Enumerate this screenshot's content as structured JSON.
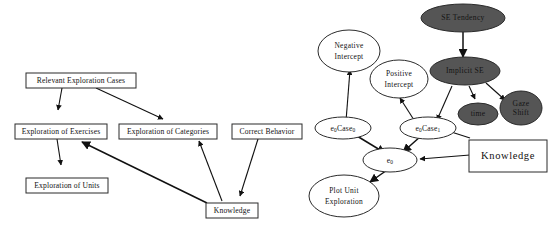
{
  "figure": {
    "colors": {
      "background": "#ffffff",
      "stroke": "#111111",
      "node_fill_light": "#ffffff",
      "node_fill_dark": "#555555"
    }
  },
  "left_diagram": {
    "name": "exploration-case-flow",
    "nodes": [
      {
        "id": "relevant_exploration_cases",
        "label": "Relevant Exploration Cases",
        "shape": "rect"
      },
      {
        "id": "exploration_of_exercises",
        "label": "Exploration of Exercises",
        "shape": "rect"
      },
      {
        "id": "exploration_of_categories",
        "label": "Exploration of Categories",
        "shape": "rect"
      },
      {
        "id": "correct_behavior",
        "label": "Correct Behavior",
        "shape": "rect"
      },
      {
        "id": "exploration_of_units",
        "label": "Exploration of Units",
        "shape": "rect"
      },
      {
        "id": "knowledge_left",
        "label": "Knowledge",
        "shape": "rect"
      }
    ],
    "edges": [
      {
        "from": "relevant_exploration_cases",
        "to": "exploration_of_exercises"
      },
      {
        "from": "relevant_exploration_cases",
        "to": "exploration_of_categories"
      },
      {
        "from": "exploration_of_exercises",
        "to": "exploration_of_units"
      },
      {
        "from": "knowledge_left",
        "to": "exploration_of_exercises"
      },
      {
        "from": "knowledge_left",
        "to": "exploration_of_categories"
      },
      {
        "from": "correct_behavior",
        "to": "knowledge_left"
      }
    ]
  },
  "right_diagram": {
    "name": "implicit-se-case-network",
    "nodes": [
      {
        "id": "se_tendency",
        "label": "SE Tendency",
        "shape": "ellipse",
        "shade": "dark"
      },
      {
        "id": "implicit_se",
        "label": "Implicit SE",
        "shape": "ellipse",
        "shade": "dark"
      },
      {
        "id": "time",
        "label": "time",
        "shape": "ellipse",
        "shade": "dark"
      },
      {
        "id": "gaze_shift",
        "label": "Gaze Shift",
        "label_lines": [
          "Gaze",
          "Shift"
        ],
        "shape": "ellipse",
        "shade": "dark"
      },
      {
        "id": "negative_intercept",
        "label": "Negative Intercept",
        "label_lines": [
          "Negative",
          "Intercept"
        ],
        "shape": "ellipse",
        "shade": "light"
      },
      {
        "id": "positive_intercept",
        "label": "Positive Intercept",
        "label_lines": [
          "Positive",
          "Intercept"
        ],
        "shape": "ellipse",
        "shade": "light"
      },
      {
        "id": "e0case0",
        "label": "e0Case0",
        "label_parts": [
          "e",
          "0",
          "Case",
          "0"
        ],
        "shape": "ellipse",
        "shade": "light"
      },
      {
        "id": "e0case1",
        "label": "e0Case1",
        "label_parts": [
          "e",
          "0",
          "Case",
          "1"
        ],
        "shape": "ellipse",
        "shade": "light"
      },
      {
        "id": "e0",
        "label": "e0",
        "label_parts": [
          "e",
          "0"
        ],
        "shape": "ellipse",
        "shade": "light"
      },
      {
        "id": "plot_unit_exploration",
        "label": "Plot Unit Exploration",
        "label_lines": [
          "Plot Unit",
          "Exploration"
        ],
        "shape": "ellipse",
        "shade": "light"
      },
      {
        "id": "knowledge_right",
        "label": "Knowledge",
        "shape": "rect"
      }
    ],
    "edges": [
      {
        "from": "se_tendency",
        "to": "implicit_se"
      },
      {
        "from": "implicit_se",
        "to": "e0case1"
      },
      {
        "from": "implicit_se",
        "to": "time"
      },
      {
        "from": "implicit_se",
        "to": "gaze_shift"
      },
      {
        "from": "e0case0",
        "to": "negative_intercept"
      },
      {
        "from": "e0case1",
        "to": "positive_intercept"
      },
      {
        "from": "e0case0",
        "to": "e0"
      },
      {
        "from": "e0case1",
        "to": "e0"
      },
      {
        "from": "knowledge_right",
        "to": "e0case1"
      },
      {
        "from": "knowledge_right",
        "to": "e0"
      },
      {
        "from": "e0",
        "to": "plot_unit_exploration"
      }
    ]
  }
}
